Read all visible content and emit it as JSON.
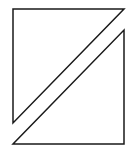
{
  "canvas": {
    "width": 133,
    "height": 150,
    "background": "#ffffff"
  },
  "diagram": {
    "stroke_color": "#1a1a1a",
    "stroke_width": 1.5,
    "fill": "none",
    "shapes": [
      {
        "name": "upper-left-triangle",
        "points": "13,9 124,9 13,123"
      },
      {
        "name": "lower-right-triangle",
        "points": "124,30 124,144 13,144"
      }
    ]
  }
}
